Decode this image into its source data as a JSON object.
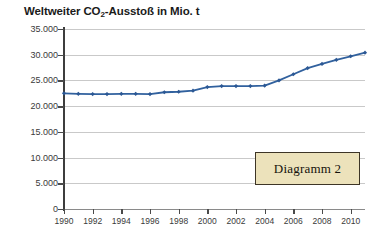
{
  "chart_data": {
    "type": "line",
    "title_main": "Weltweiter CO",
    "title_sub": "2",
    "title_rest": "-Ausstoß in Mio. t",
    "xlabel": "",
    "ylabel": "",
    "grid": true,
    "legend": "none",
    "line_color": "#31619e",
    "marker_color": "#2c5894",
    "ylim": [
      0,
      35000
    ],
    "ytick_values": [
      0,
      5000,
      10000,
      15000,
      20000,
      25000,
      30000,
      35000
    ],
    "ytick_labels": [
      "0",
      "5.000",
      "10.000",
      "15.000",
      "20.000",
      "25.000",
      "30.000",
      "35.000"
    ],
    "xlim": [
      1990,
      2011
    ],
    "xtick_values": [
      1990,
      1992,
      1994,
      1996,
      1998,
      2000,
      2002,
      2004,
      2006,
      2008,
      2010
    ],
    "xtick_labels": [
      "1990",
      "1992",
      "1994",
      "1996",
      "1998",
      "2000",
      "2002",
      "2004",
      "2006",
      "2008",
      "2010"
    ],
    "x": [
      1990,
      1991,
      1992,
      1993,
      1994,
      1995,
      1996,
      1997,
      1998,
      1999,
      2000,
      2001,
      2002,
      2003,
      2004,
      2005,
      2006,
      2007,
      2008,
      2009,
      2010,
      2011
    ],
    "values": [
      22500,
      22400,
      22350,
      22350,
      22400,
      22400,
      22350,
      22700,
      22800,
      23000,
      23700,
      23900,
      23900,
      23900,
      24000,
      25000,
      26200,
      27400,
      28200,
      29000,
      29700,
      30400
    ],
    "series": [
      {
        "name": "CO₂-Ausstoß",
        "x": [
          1990,
          1991,
          1992,
          1993,
          1994,
          1995,
          1996,
          1997,
          1998,
          1999,
          2000,
          2001,
          2002,
          2003,
          2004,
          2005,
          2006,
          2007,
          2008,
          2009,
          2010,
          2011
        ],
        "values": [
          22500,
          22400,
          22350,
          22350,
          22400,
          22400,
          22350,
          22700,
          22800,
          23000,
          23700,
          23900,
          23900,
          23900,
          24000,
          25000,
          26200,
          27400,
          28200,
          29000,
          29700,
          30400
        ]
      }
    ]
  },
  "annotation": {
    "label": "Diagramm 2"
  }
}
